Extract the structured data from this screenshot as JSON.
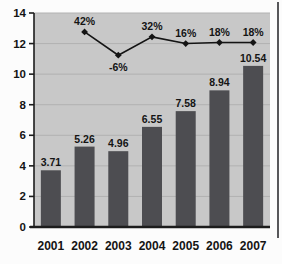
{
  "chart_data": {
    "type": "bar",
    "subtype": "bar-with-line-overlay",
    "title": "",
    "xlabel": "",
    "ylabel": "",
    "categories": [
      "2001",
      "2002",
      "2003",
      "2004",
      "2005",
      "2006",
      "2007"
    ],
    "bar_series": {
      "name": "annual-value-bars",
      "values": [
        3.71,
        5.26,
        4.96,
        6.55,
        7.58,
        8.94,
        10.54
      ],
      "data_labels": [
        "3.71",
        "5.26",
        "4.96",
        "6.55",
        "7.58",
        "8.94",
        "10.54"
      ]
    },
    "line_series": {
      "name": "growth-percent-line",
      "note": "line starts at 2002; percentage labels shown at markers",
      "points": [
        {
          "category": "2002",
          "label": "42%",
          "plotted_y_left_axis": 12.76,
          "label_pos": "above"
        },
        {
          "category": "2003",
          "label": "-6%",
          "plotted_y_left_axis": 11.24,
          "label_pos": "below"
        },
        {
          "category": "2004",
          "label": "32%",
          "plotted_y_left_axis": 12.44,
          "label_pos": "above"
        },
        {
          "category": "2005",
          "label": "16%",
          "plotted_y_left_axis": 12.0,
          "label_pos": "above"
        },
        {
          "category": "2006",
          "label": "18%",
          "plotted_y_left_axis": 12.07,
          "label_pos": "above"
        },
        {
          "category": "2007",
          "label": "18%",
          "plotted_y_left_axis": 12.07,
          "label_pos": "above"
        }
      ]
    },
    "ylim": [
      0,
      14
    ],
    "yticks": [
      "0",
      "2",
      "4",
      "6",
      "8",
      "10",
      "12",
      "14"
    ],
    "grid": "horizontal",
    "legend": "none",
    "colors": {
      "plot_background": "#c8c8c8",
      "gridline": "#b2b2b2",
      "bar_fill": "#4d4d51",
      "axis": "#1c1c1c",
      "line": "#141414",
      "marker": "#141414",
      "text": "#141414",
      "right_frame": "#57575a",
      "page_background": "#fcfcfc"
    }
  }
}
